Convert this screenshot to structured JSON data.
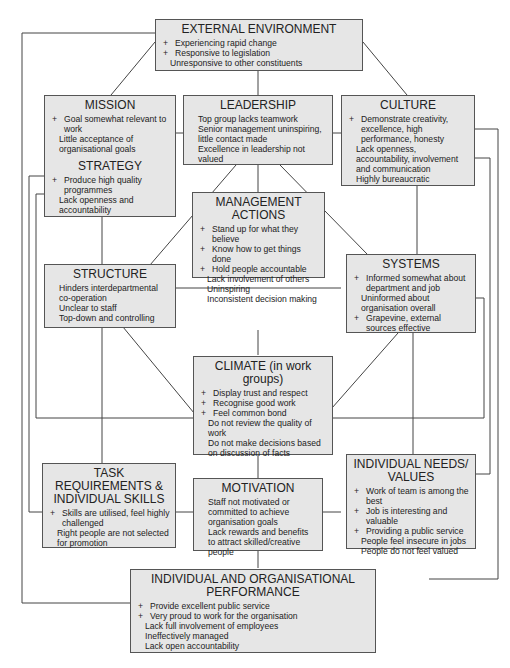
{
  "boxes": {
    "external": {
      "title": "EXTERNAL ENVIRONMENT",
      "items": [
        {
          "sign": "+",
          "text": "Experiencing rapid change"
        },
        {
          "sign": "+",
          "text": "Responsive to legislation"
        },
        {
          "sign": "-",
          "text": "Unresponsive to other constituents"
        }
      ]
    },
    "mission": {
      "title": "MISSION",
      "items": [
        {
          "sign": "+",
          "text": "Goal somewhat relevant to work"
        },
        {
          "sign": "-",
          "text": "Little acceptance of organisational goals"
        }
      ]
    },
    "strategy": {
      "title": "STRATEGY",
      "items": [
        {
          "sign": "+",
          "text": "Produce high quality programmes"
        },
        {
          "sign": "-",
          "text": "Lack openness and accountability"
        }
      ]
    },
    "leadership": {
      "title": "LEADERSHIP",
      "items": [
        {
          "sign": "-",
          "text": "Top group lacks teamwork"
        },
        {
          "sign": "-",
          "text": "Senior management uninspiring, little contact made"
        },
        {
          "sign": "-",
          "text": "Excellence in leadership not valued"
        }
      ]
    },
    "culture": {
      "title": "CULTURE",
      "items": [
        {
          "sign": "+",
          "text": "Demonstrate creativity, excellence, high performance, honesty"
        },
        {
          "sign": "-",
          "text": "Lack openness, accountability, involvement and communication"
        },
        {
          "sign": "-",
          "text": "Highly bureaucratic"
        }
      ]
    },
    "management_actions": {
      "title": "MANAGEMENT ACTIONS",
      "items": [
        {
          "sign": "+",
          "text": "Stand up for what they believe"
        },
        {
          "sign": "+",
          "text": "Know how to get things done"
        },
        {
          "sign": "+",
          "text": "Hold people accountable"
        },
        {
          "sign": "-",
          "text": "Lack involvement of others"
        },
        {
          "sign": "-",
          "text": "Uninspiring"
        },
        {
          "sign": "-",
          "text": "Inconsistent decision making"
        }
      ]
    },
    "structure": {
      "title": "STRUCTURE",
      "items": [
        {
          "sign": "-",
          "text": "Hinders interdepartmental co-operation"
        },
        {
          "sign": "-",
          "text": "Unclear to staff"
        },
        {
          "sign": "-",
          "text": "Top-down and controlling"
        }
      ]
    },
    "systems": {
      "title": "SYSTEMS",
      "items": [
        {
          "sign": "+",
          "text": "Informed somewhat about department and job"
        },
        {
          "sign": "-",
          "text": "Uninformed about organisation overall"
        },
        {
          "sign": "+",
          "text": "Grapevine, external sources effective"
        }
      ]
    },
    "climate": {
      "title": "CLIMATE (in work groups)",
      "items": [
        {
          "sign": "+",
          "text": "Display trust and respect"
        },
        {
          "sign": "+",
          "text": "Recognise good work"
        },
        {
          "sign": "+",
          "text": "Feel common bond"
        },
        {
          "sign": "-",
          "text": "Do not review the quality of work"
        },
        {
          "sign": "-",
          "text": "Do not make decisions based on discussion of facts"
        }
      ]
    },
    "task_requirements": {
      "title": "TASK REQUIREMENTS & INDIVIDUAL SKILLS",
      "items": [
        {
          "sign": "+",
          "text": "Skills are utilised, feel highly challenged"
        },
        {
          "sign": "-",
          "text": "Right people are not selected for promotion"
        }
      ]
    },
    "motivation": {
      "title": "MOTIVATION",
      "items": [
        {
          "sign": "-",
          "text": "Staff not motivated or committed to achieve organisation goals"
        },
        {
          "sign": "-",
          "text": "Lack rewards and benefits to attract skilled/creative people"
        }
      ]
    },
    "individual_needs": {
      "title": "INDIVIDUAL NEEDS/ VALUES",
      "items": [
        {
          "sign": "+",
          "text": "Work of team is among the best"
        },
        {
          "sign": "+",
          "text": "Job is interesting and valuable"
        },
        {
          "sign": "+",
          "text": "Providing a public service"
        },
        {
          "sign": "-",
          "text": "People feel insecure in jobs"
        },
        {
          "sign": "-",
          "text": "People do not feel valued"
        }
      ]
    },
    "performance": {
      "title": "INDIVIDUAL AND ORGANISATIONAL PERFORMANCE",
      "items": [
        {
          "sign": "+",
          "text": "Provide excellent public service"
        },
        {
          "sign": "+",
          "text": "Very proud to work for the organisation"
        },
        {
          "sign": "-",
          "text": "Lack full involvement of employees"
        },
        {
          "sign": "-",
          "text": "Ineffectively managed"
        },
        {
          "sign": "-",
          "text": "Lack open accountability"
        }
      ]
    }
  },
  "colors": {
    "box_fill": "#e6e6e6",
    "box_border": "#555555",
    "line": "#444444"
  }
}
